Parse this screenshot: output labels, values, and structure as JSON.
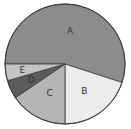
{
  "chart_data": {
    "type": "pie",
    "title": "",
    "categories": [
      "A",
      "B",
      "C",
      "D",
      "E"
    ],
    "values": [
      55,
      20,
      15.5,
      5,
      4.5
    ],
    "unit": "percent (estimated)",
    "start_angle_deg": 180,
    "direction": "clockwise",
    "legend": "none (labels inside slices)",
    "colors": [
      "#8c8c8c",
      "#ececec",
      "#b5b5b5",
      "#5c5c5c",
      "#c4c4c4"
    ]
  },
  "slices": [
    {
      "label": "A",
      "color": "#8c8c8c"
    },
    {
      "label": "B",
      "color": "#ececec"
    },
    {
      "label": "C",
      "color": "#b5b5b5"
    },
    {
      "label": "D",
      "color": "#5c5c5c"
    },
    {
      "label": "E",
      "color": "#c4c4c4"
    }
  ],
  "border_color": "#3a3a3a"
}
